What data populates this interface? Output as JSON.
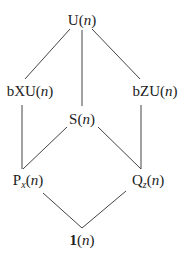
{
  "diagram": {
    "type": "lattice",
    "nodes": [
      {
        "id": "U",
        "prefix": "U",
        "sub": "",
        "arg": "n",
        "x": 82,
        "y": 20
      },
      {
        "id": "bXU",
        "prefix": "bXU",
        "sub": "",
        "arg": "n",
        "x": 30,
        "y": 91
      },
      {
        "id": "bZU",
        "prefix": "bZU",
        "sub": "",
        "arg": "n",
        "x": 155,
        "y": 91
      },
      {
        "id": "S",
        "prefix": "S",
        "sub": "",
        "arg": "n",
        "x": 82,
        "y": 119
      },
      {
        "id": "Px",
        "prefix": "P",
        "sub": "x",
        "arg": "n",
        "x": 28,
        "y": 181
      },
      {
        "id": "Qz",
        "prefix": "Q",
        "sub": "z",
        "arg": "n",
        "x": 148,
        "y": 181
      },
      {
        "id": "one",
        "prefix": "1",
        "sub": "",
        "arg": "n",
        "x": 82,
        "y": 240,
        "bold": true
      }
    ],
    "edges": [
      {
        "from": "U",
        "to": "bXU",
        "x1": 70,
        "y1": 29,
        "x2": 25,
        "y2": 79
      },
      {
        "from": "U",
        "to": "S",
        "x1": 82,
        "y1": 30,
        "x2": 82,
        "y2": 106
      },
      {
        "from": "U",
        "to": "bZU",
        "x1": 92,
        "y1": 29,
        "x2": 140,
        "y2": 79
      },
      {
        "from": "bXU",
        "to": "Px",
        "x1": 22,
        "y1": 105,
        "x2": 22,
        "y2": 169
      },
      {
        "from": "bZU",
        "to": "Qz",
        "x1": 141,
        "y1": 105,
        "x2": 141,
        "y2": 169
      },
      {
        "from": "S",
        "to": "Px",
        "x1": 67,
        "y1": 127,
        "x2": 23,
        "y2": 169
      },
      {
        "from": "S",
        "to": "Qz",
        "x1": 98,
        "y1": 127,
        "x2": 141,
        "y2": 169
      },
      {
        "from": "Px",
        "to": "one",
        "x1": 43,
        "y1": 193,
        "x2": 82,
        "y2": 228
      },
      {
        "from": "Qz",
        "to": "one",
        "x1": 126,
        "y1": 191,
        "x2": 82,
        "y2": 228
      }
    ],
    "line_color": "#444444",
    "text_color": "#222222"
  },
  "labels": {
    "U": {
      "prefix": "U",
      "open": "(",
      "arg": "n",
      "close": ")"
    },
    "bXU": {
      "prefix": "bXU",
      "open": "(",
      "arg": "n",
      "close": ")"
    },
    "bZU": {
      "prefix": "bZU",
      "open": "(",
      "arg": "n",
      "close": ")"
    },
    "S": {
      "prefix": "S",
      "open": "(",
      "arg": "n",
      "close": ")"
    },
    "Px": {
      "prefix": "P",
      "sub": "x",
      "open": "(",
      "arg": "n",
      "close": ")"
    },
    "Qz": {
      "prefix": "Q",
      "sub": "z",
      "open": "(",
      "arg": "n",
      "close": ")"
    },
    "one": {
      "prefix": "1",
      "open": "(",
      "arg": "n",
      "close": ")"
    }
  }
}
